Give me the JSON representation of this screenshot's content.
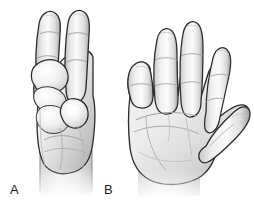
{
  "figure": {
    "background_color": "#ffffff",
    "width": 254,
    "height": 204,
    "style": "grayscale line drawing with soft shading",
    "panels": [
      {
        "key": "a",
        "label": "A",
        "label_x": 10,
        "label_y": 183,
        "description": "Hand with index and middle fingers extended upward, thumb and remaining fingers flexed into the palm",
        "fingers_extended": 2,
        "view": "dorsal/lateral"
      },
      {
        "key": "b",
        "label": "B",
        "label_x": 104,
        "label_y": 183,
        "description": "Open hand, palm facing viewer, all four fingers extended and thumb abducted",
        "fingers_extended": 4,
        "view": "palmar"
      }
    ]
  },
  "colors": {
    "background": "#ffffff",
    "outline": "#2b2b2b",
    "outline_soft": "#6d6d6d",
    "skin_light": "#f4f4f4",
    "skin_mid": "#dcdcdc",
    "skin_shadow": "#b9b9b9",
    "skin_deep_shadow": "#9a9a9a",
    "crease": "#8c8c8c",
    "highlight": "#fcfcfc",
    "label_text": "#1b1b1b"
  }
}
